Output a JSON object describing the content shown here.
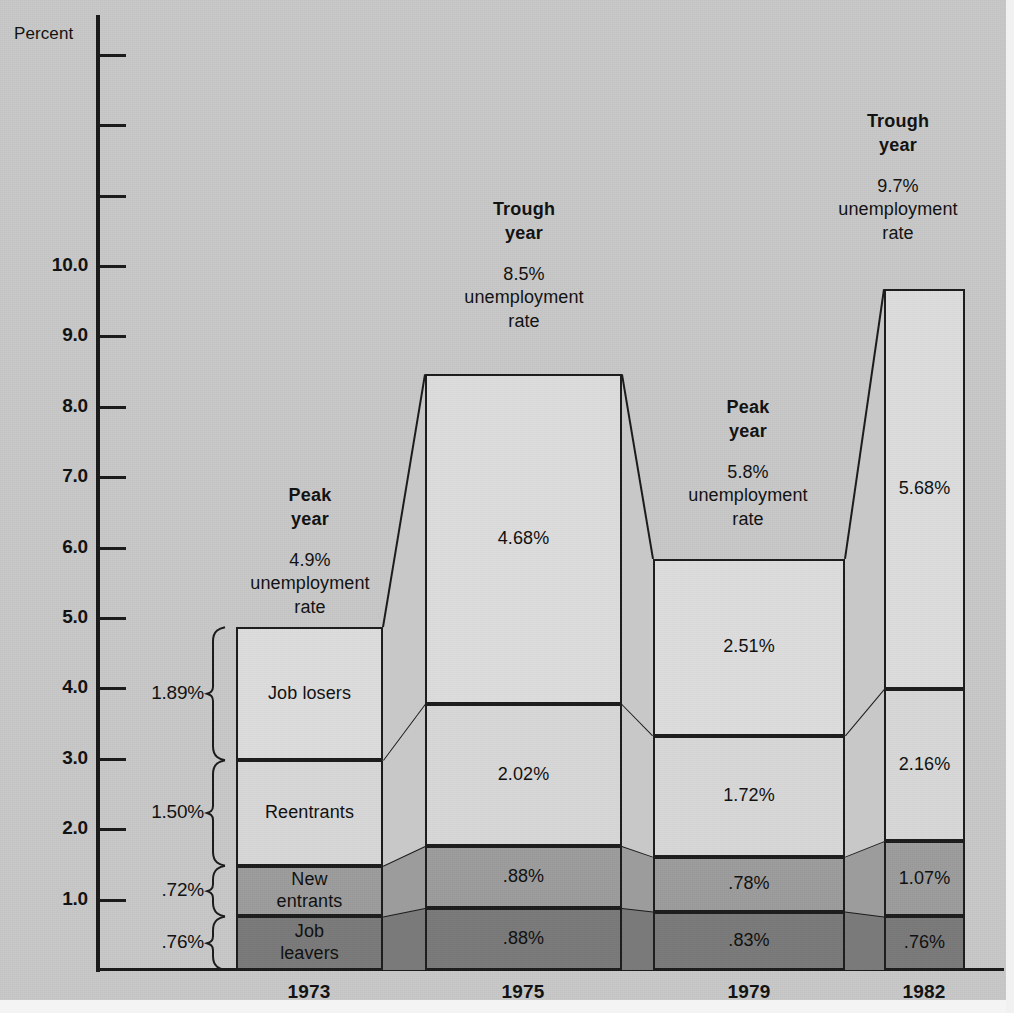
{
  "chart_data": {
    "type": "bar",
    "title": "",
    "subtitle": "",
    "xlabel": "",
    "ylabel": "Percent",
    "ylim": [
      0,
      13
    ],
    "grid": false,
    "legend_position": "in-bar-labels",
    "stacked": true,
    "categories": [
      "1973",
      "1975",
      "1979",
      "1982"
    ],
    "series": [
      {
        "name": "Job losers",
        "values": [
          1.89,
          4.68,
          2.51,
          5.68
        ],
        "value_labels": [
          "Job losers",
          "4.68%",
          "2.51%",
          "5.68%"
        ],
        "color": "#dddddd"
      },
      {
        "name": "Reentrants",
        "values": [
          1.5,
          2.02,
          1.72,
          2.16
        ],
        "value_labels": [
          "Reentrants",
          "2.02%",
          "1.72%",
          "2.16%"
        ],
        "color": "#d8d8d8"
      },
      {
        "name": "New entrants",
        "values": [
          0.72,
          0.88,
          0.78,
          1.07
        ],
        "value_labels": [
          "New\nentrants",
          ".88%",
          ".78%",
          "1.07%"
        ],
        "color": "#9c9c9c"
      },
      {
        "name": "Job leavers",
        "values": [
          0.76,
          0.88,
          0.83,
          0.76
        ],
        "value_labels": [
          "Job\nleavers",
          ".88%",
          ".83%",
          ".76%"
        ],
        "color": "#7a7a7a"
      }
    ],
    "totals": [
      4.87,
      8.46,
      5.84,
      9.67
    ],
    "annotations": [
      {
        "category": "1973",
        "phase": "Peak\nyear",
        "rate": "4.9%\nunemployment\nrate"
      },
      {
        "category": "1975",
        "phase": "Trough\nyear",
        "rate": "8.5%\nunemployment\nrate"
      },
      {
        "category": "1979",
        "phase": "Peak\nyear",
        "rate": "5.8%\nunemployment\nrate"
      },
      {
        "category": "1982",
        "phase": "Trough\nyear",
        "rate": "9.7%\nunemployment\nrate"
      }
    ],
    "brace_values_1973": [
      "1.89%",
      "1.50%",
      ".72%",
      ".76%"
    ],
    "ytick_labels": [
      "10.0",
      "9.0",
      "8.0",
      "7.0",
      "6.0",
      "5.0",
      "4.0",
      "3.0",
      "2.0",
      "1.0"
    ],
    "ytick_values": [
      10,
      9,
      8,
      7,
      6,
      5,
      4,
      3,
      2,
      1
    ],
    "unlabeled_ytick_values": [
      13,
      12,
      11
    ]
  },
  "axis": {
    "percent_label": "Percent"
  },
  "colors": {
    "background": "#c8c8c8",
    "job_losers": "#dddddd",
    "reentrants": "#d8d8d8",
    "new_entrants": "#9c9c9c",
    "job_leavers": "#7a7a7a",
    "ink": "#1a1a1a"
  }
}
